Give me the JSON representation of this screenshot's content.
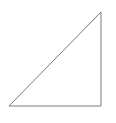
{
  "diagram": {
    "shape": "right-triangle",
    "stroke_color": "#7a7a7a",
    "fill_color": "none",
    "stroke_width": 1,
    "vertices": [
      {
        "name": "top",
        "x": 101,
        "y": 12
      },
      {
        "name": "bottom-left",
        "x": 9,
        "y": 106
      },
      {
        "name": "bottom-right",
        "x": 101,
        "y": 106
      }
    ]
  }
}
